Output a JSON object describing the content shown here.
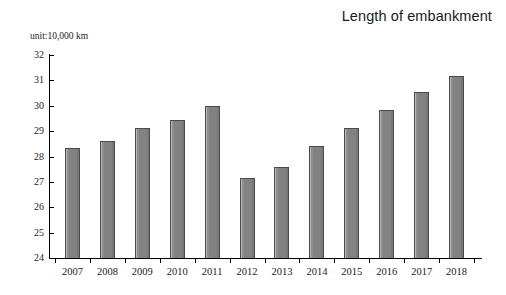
{
  "title": "Length of embankment",
  "unit_label": "unit:10,000 km",
  "colors": {
    "bar_fill": "#828282",
    "bar_border": "#4a4a4a",
    "axis": "#000000",
    "text": "#1a1a1a",
    "background": "#ffffff"
  },
  "chart_data": {
    "type": "bar",
    "title": "Length of embankment",
    "subtitle": "unit:10,000 km",
    "xlabel": "",
    "ylabel": "",
    "ylim": [
      24,
      32
    ],
    "ytick_step": 1,
    "yticks": [
      32,
      31,
      30,
      29,
      28,
      27,
      26,
      25,
      24
    ],
    "ytick_labels": [
      "32",
      "31",
      "30",
      "29",
      "28",
      "27",
      "26",
      "25",
      "24"
    ],
    "grid": false,
    "legend": false,
    "categories": [
      "2007",
      "2008",
      "2009",
      "2010",
      "2011",
      "2012",
      "2013",
      "2014",
      "2015",
      "2016",
      "2017",
      "2018"
    ],
    "values": [
      28.33,
      28.63,
      29.13,
      29.42,
      30.0,
      27.15,
      27.57,
      28.4,
      29.12,
      29.85,
      30.55,
      31.17
    ]
  }
}
